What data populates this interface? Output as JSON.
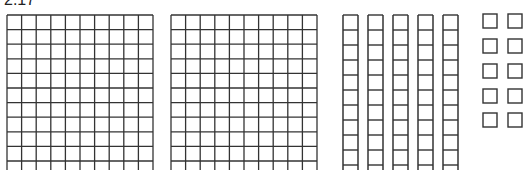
{
  "figure": {
    "label": "2.17",
    "line_color": "#333333",
    "background": "#ffffff"
  },
  "blocks": {
    "flats": [
      {
        "name": "hundred-flat-1",
        "x": 7,
        "y": 15,
        "cols": 10,
        "rows": 11,
        "cell": 14.6
      },
      {
        "name": "hundred-flat-2",
        "x": 171,
        "y": 15,
        "cols": 10,
        "rows": 11,
        "cell": 14.6
      }
    ],
    "rods": {
      "count": 5,
      "x": [
        343,
        368,
        393,
        418,
        443
      ],
      "y": 15,
      "width": 15,
      "cell": 15,
      "cells": 11
    },
    "units": {
      "count": 10,
      "size": 14,
      "columns_x": [
        483,
        508
      ],
      "rows_y": [
        14,
        39,
        64,
        89,
        113
      ]
    }
  }
}
